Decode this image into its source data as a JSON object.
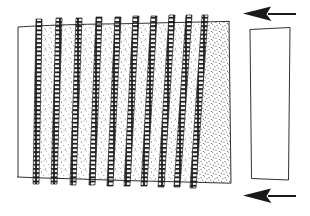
{
  "figure": {
    "title": "Hand-drawn shear deformation sketch",
    "background_color": "#ffffff",
    "ink_color": "#1a1a1a",
    "stipple_color": "#3a3a3a",
    "width": 310,
    "height": 216
  },
  "deformed_block": {
    "name": "sheared block",
    "label": "",
    "top_left": [
      18,
      27
    ],
    "top_right": [
      228,
      22
    ],
    "bottom_right": [
      231,
      182
    ],
    "bottom_left": [
      17,
      177
    ],
    "outline_style": "hand-drawn thin ink",
    "column_count": 11,
    "shear_sense": "top-to-the-left",
    "columns": [
      {
        "index": 0,
        "fill": "blank",
        "x_top": 18,
        "x_bottom": 17,
        "width_top": 22,
        "width_bottom": 20
      },
      {
        "index": 1,
        "fill": "stipple",
        "x_top": 40,
        "x_bottom": 37,
        "width_top": 20,
        "width_bottom": 18
      },
      {
        "index": 2,
        "fill": "stipple",
        "x_top": 60,
        "x_bottom": 55,
        "width_top": 20,
        "width_bottom": 19
      },
      {
        "index": 3,
        "fill": "stipple",
        "x_top": 80,
        "x_bottom": 74,
        "width_top": 20,
        "width_bottom": 19
      },
      {
        "index": 4,
        "fill": "stipple",
        "x_top": 100,
        "x_bottom": 93,
        "width_top": 19,
        "width_bottom": 18
      },
      {
        "index": 5,
        "fill": "stipple",
        "x_top": 119,
        "x_bottom": 111,
        "width_top": 18,
        "width_bottom": 17
      },
      {
        "index": 6,
        "fill": "stipple",
        "x_top": 137,
        "x_bottom": 128,
        "width_top": 18,
        "width_bottom": 17
      },
      {
        "index": 7,
        "fill": "stipple",
        "x_top": 155,
        "x_bottom": 145,
        "width_top": 18,
        "width_bottom": 17
      },
      {
        "index": 8,
        "fill": "stipple",
        "x_top": 173,
        "x_bottom": 162,
        "width_top": 17,
        "width_bottom": 16
      },
      {
        "index": 9,
        "fill": "stipple",
        "x_top": 190,
        "x_bottom": 178,
        "width_top": 16,
        "width_bottom": 16
      },
      {
        "index": 10,
        "fill": "stipple-dense",
        "x_top": 206,
        "x_bottom": 194,
        "width_top": 24,
        "width_bottom": 38
      }
    ],
    "bands": [
      {
        "index": 0,
        "x_top": 38,
        "x_bottom": 35,
        "thickness": 5,
        "texture": "ladder"
      },
      {
        "index": 1,
        "x_top": 58,
        "x_bottom": 53,
        "thickness": 5,
        "texture": "ladder"
      },
      {
        "index": 2,
        "x_top": 78,
        "x_bottom": 72,
        "thickness": 5,
        "texture": "ladder"
      },
      {
        "index": 3,
        "x_top": 98,
        "x_bottom": 91,
        "thickness": 5,
        "texture": "ladder"
      },
      {
        "index": 4,
        "x_top": 117,
        "x_bottom": 109,
        "thickness": 5,
        "texture": "ladder"
      },
      {
        "index": 5,
        "x_top": 135,
        "x_bottom": 126,
        "thickness": 5,
        "texture": "ladder"
      },
      {
        "index": 6,
        "x_top": 153,
        "x_bottom": 143,
        "thickness": 5,
        "texture": "ladder"
      },
      {
        "index": 7,
        "x_top": 171,
        "x_bottom": 160,
        "thickness": 5,
        "texture": "ladder"
      },
      {
        "index": 8,
        "x_top": 188,
        "x_bottom": 176,
        "thickness": 5,
        "texture": "ladder"
      },
      {
        "index": 9,
        "x_top": 204,
        "x_bottom": 192,
        "thickness": 5,
        "texture": "ladder"
      }
    ]
  },
  "reference_block": {
    "name": "undeformed reference block",
    "label": "",
    "top_left": [
      250,
      29
    ],
    "top_right": [
      290,
      27
    ],
    "bottom_right": [
      288,
      180
    ],
    "bottom_left": [
      251,
      178
    ],
    "fill": "blank",
    "outline_style": "hand-drawn thin ink"
  },
  "arrows": [
    {
      "name": "top shear arrow",
      "direction": "left",
      "label": "",
      "tail_x": 296,
      "head_x": 245,
      "y": 14
    },
    {
      "name": "bottom shear arrow",
      "direction": "left",
      "label": "",
      "tail_x": 296,
      "head_x": 245,
      "y": 196
    }
  ]
}
